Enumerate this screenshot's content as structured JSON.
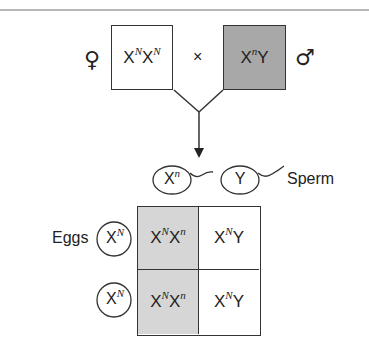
{
  "diagram": {
    "type": "punnett-square",
    "parents": {
      "female": {
        "symbol": "♀",
        "genotype_base": "X",
        "genotype": [
          {
            "base": "X",
            "sup": "N"
          },
          {
            "base": "X",
            "sup": "N"
          }
        ],
        "fill": "#ffffff"
      },
      "cross_symbol": "×",
      "male": {
        "symbol": "♂",
        "genotype": [
          {
            "base": "X",
            "sup": "n"
          },
          {
            "base": "Y",
            "sup": ""
          }
        ],
        "fill": "#a8a8a8"
      }
    },
    "sperm": {
      "label": "Sperm",
      "gametes": [
        {
          "base": "X",
          "sup": "n"
        },
        {
          "base": "Y",
          "sup": ""
        }
      ]
    },
    "eggs": {
      "label": "Eggs",
      "gametes": [
        {
          "base": "X",
          "sup": "N"
        },
        {
          "base": "X",
          "sup": "N"
        }
      ]
    },
    "grid": {
      "cells": [
        [
          {
            "a": "X",
            "as": "N",
            "b": "X",
            "bs": "n",
            "fill": "#d6d6d6"
          },
          {
            "a": "X",
            "as": "N",
            "b": "Y",
            "bs": "",
            "fill": "#ffffff"
          }
        ],
        [
          {
            "a": "X",
            "as": "N",
            "b": "X",
            "bs": "n",
            "fill": "#d6d6d6"
          },
          {
            "a": "X",
            "as": "N",
            "b": "Y",
            "bs": "",
            "fill": "#ffffff"
          }
        ]
      ]
    }
  }
}
